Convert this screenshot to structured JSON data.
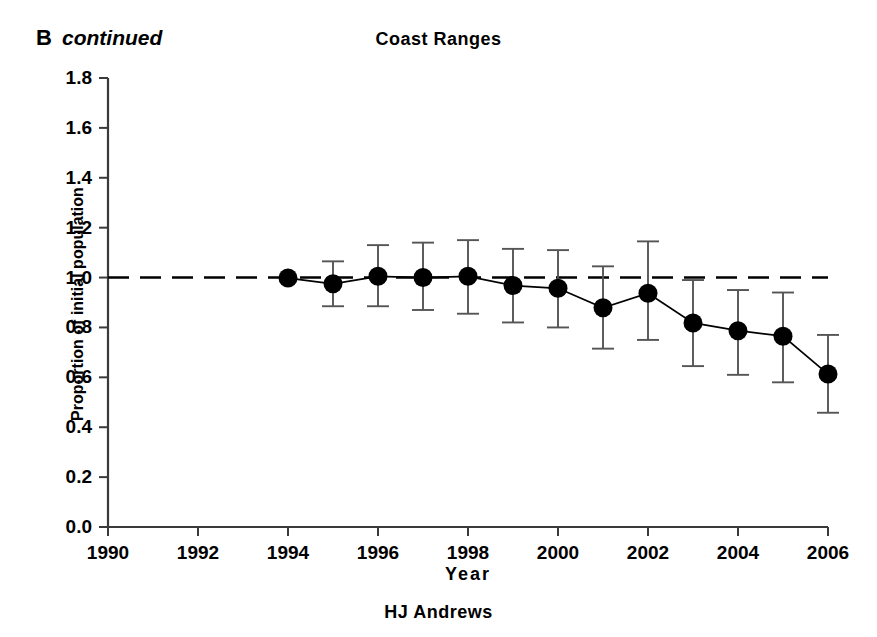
{
  "panel": {
    "letter": "B",
    "continued_note": "continued"
  },
  "caption": {
    "bottom": "HJ Andrews"
  },
  "chart_data": {
    "type": "line",
    "title": "Coast Ranges",
    "xlabel": "Year",
    "ylabel": "Proportion of initial population",
    "xlim": [
      1990,
      2006
    ],
    "ylim": [
      0.0,
      1.8
    ],
    "xticks": [
      1990,
      1992,
      1994,
      1996,
      1998,
      2000,
      2002,
      2004,
      2006
    ],
    "xtick_labels": [
      "1990",
      "1992",
      "1994",
      "1996",
      "1998",
      "2000",
      "2002",
      "2004",
      "2006"
    ],
    "yticks": [
      0.0,
      0.2,
      0.4,
      0.6,
      0.8,
      1.0,
      1.2,
      1.4,
      1.6,
      1.8
    ],
    "ytick_labels": [
      "0.0",
      "0.2",
      "0.4",
      "0.6",
      "0.8",
      "1.0",
      "1.2",
      "1.4",
      "1.6",
      "1.8"
    ],
    "grid": false,
    "legend": null,
    "reference_line": {
      "y": 1.0,
      "style": "dashed",
      "color": "#000000"
    },
    "marker": "filled-circle",
    "error_bars": "vertical-with-caps",
    "series": [
      {
        "name": "Coast Ranges proportion of initial population",
        "color": "#000000",
        "x": [
          1994,
          1995,
          1996,
          1997,
          1998,
          1999,
          2000,
          2001,
          2002,
          2003,
          2004,
          2005,
          2006
        ],
        "values": [
          0.998,
          0.975,
          1.005,
          1.0,
          1.005,
          0.968,
          0.957,
          0.879,
          0.937,
          0.818,
          0.787,
          0.765,
          0.613
        ],
        "err_low": [
          0.998,
          0.885,
          0.885,
          0.87,
          0.855,
          0.82,
          0.8,
          0.715,
          0.75,
          0.645,
          0.61,
          0.58,
          0.458
        ],
        "err_high": [
          0.998,
          1.065,
          1.13,
          1.14,
          1.15,
          1.115,
          1.11,
          1.045,
          1.145,
          0.99,
          0.95,
          0.94,
          0.77
        ]
      }
    ]
  },
  "plot_geometry": {
    "left_px": 108,
    "right_px": 828,
    "top_px": 78,
    "bottom_px": 527
  }
}
